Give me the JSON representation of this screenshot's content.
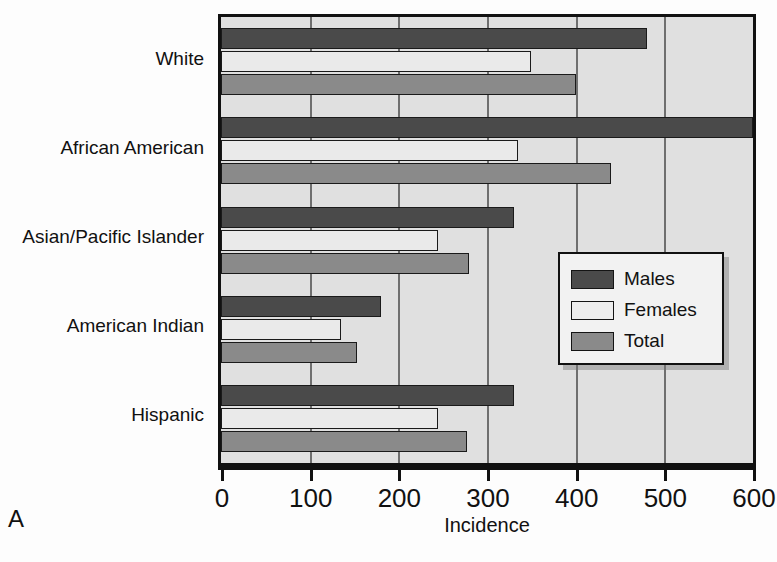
{
  "panel": {
    "letter": "A"
  },
  "chart_data": {
    "type": "bar",
    "orientation": "horizontal",
    "title": "",
    "xlabel": "Incidence",
    "ylabel": "",
    "xlim": [
      0,
      600
    ],
    "xticks": [
      0,
      100,
      200,
      300,
      400,
      500,
      600
    ],
    "xticklabels": [
      "0",
      "100",
      "200",
      "300",
      "400",
      "500",
      "600"
    ],
    "grid": true,
    "legend_position": "center-right",
    "categories": [
      "White",
      "African American",
      "Asian/Pacific Islander",
      "American Indian",
      "Hispanic"
    ],
    "series": [
      {
        "name": "Males",
        "color": "#4a4a4a",
        "values": [
          480,
          600,
          330,
          180,
          330
        ]
      },
      {
        "name": "Females",
        "color": "#eaeaea",
        "values": [
          350,
          335,
          245,
          135,
          245
        ]
      },
      {
        "name": "Total",
        "color": "#8a8a8a",
        "values": [
          400,
          440,
          280,
          153,
          278
        ]
      }
    ]
  }
}
